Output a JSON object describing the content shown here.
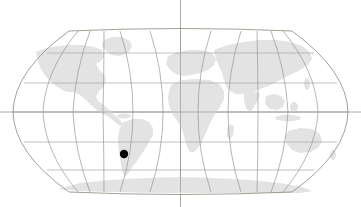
{
  "figure": {
    "kind": "world-map",
    "title": "World map with single point location marker",
    "width": 361,
    "height": 207,
    "background_color": "#ffffff",
    "projection": "robinson"
  },
  "style": {
    "land_color": "#e3e3e3",
    "land_color_light": "#eaeaea",
    "graticule_color": "#8c8878",
    "graticule_color_faint": "#b9b5ab",
    "axis_color": "#9a968c",
    "outline_color": "#8c8878",
    "marker_color": "#000000"
  },
  "globe": {
    "left": 13,
    "right": 348,
    "top": 30,
    "bottom": 193,
    "center_x": 180.5,
    "center_y": 111.5
  },
  "graticule": {
    "meridian_spacing_px": 30,
    "meridian_count": 12,
    "meridian_x_positions": [
      13,
      43,
      73,
      103,
      133,
      163,
      180.5,
      198,
      228,
      258,
      288,
      318,
      348
    ],
    "parallel_count": 5,
    "parallel_y_positions": [
      53,
      83,
      112,
      142,
      170
    ],
    "equator_y": 112,
    "central_meridian_x": 180.5,
    "equator_full_width": true,
    "central_meridian_full_height": true
  },
  "markers": [
    {
      "name": "location-marker",
      "label": "",
      "x": 124,
      "y": 154,
      "radius": 4.2,
      "color": "#000000",
      "region": "southern South America"
    }
  ],
  "landmasses": [
    {
      "name": "north-america"
    },
    {
      "name": "south-america"
    },
    {
      "name": "greenland"
    },
    {
      "name": "europe"
    },
    {
      "name": "africa"
    },
    {
      "name": "asia"
    },
    {
      "name": "australia"
    },
    {
      "name": "antarctica"
    }
  ],
  "chart_data": {
    "type": "map",
    "title": "World map with single point location marker",
    "projection": "robinson",
    "xlabel": "Longitude",
    "ylabel": "Latitude",
    "xlim": [
      -180,
      180
    ],
    "ylim": [
      -90,
      90
    ],
    "grid": true,
    "graticule_interval_degrees": 30,
    "legend": "none",
    "points": [
      {
        "name": "location-marker",
        "longitude": -65,
        "latitude": -44,
        "pixel_x": 124,
        "pixel_y": 154,
        "color": "#000000",
        "size_px": 8.4
      }
    ],
    "annotations": []
  }
}
